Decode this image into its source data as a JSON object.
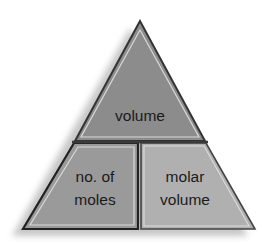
{
  "diagram": {
    "type": "formula-triangle",
    "top": {
      "label": "volume"
    },
    "bottom_left": {
      "lines": [
        "no. of",
        "moles"
      ]
    },
    "bottom_right": {
      "lines": [
        "molar",
        "volume"
      ]
    }
  },
  "colors": {
    "top_fill": "#8c8c8c",
    "bottom_left_fill": "#9a9a9a",
    "bottom_right_fill": "#b0b0b0",
    "outline": "#333333",
    "inner_highlight": "#d8d8d8",
    "shadow": "#c8c8c8"
  }
}
